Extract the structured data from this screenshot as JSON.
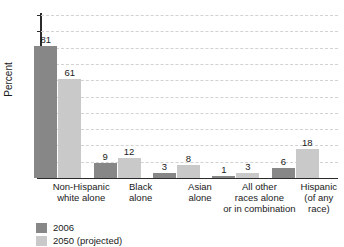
{
  "chart_data": {
    "type": "bar",
    "title": "",
    "xlabel": "",
    "ylabel": "Percent",
    "ylim": [
      0,
      100
    ],
    "ytick_step": 10,
    "yticks": [
      100,
      90,
      80,
      70,
      60,
      50,
      40,
      30,
      20,
      10,
      0
    ],
    "grid": true,
    "grid_style": "dashed-horizontal",
    "legend_position": "bottom-left",
    "categories": [
      "Non-Hispanic\nwhite alone",
      "Black\nalone",
      "Asian\nalone",
      "All other\nraces alone\nor in combination",
      "Hispanic\n(of any\nrace)"
    ],
    "category_lines": [
      [
        "Non-Hispanic",
        "white alone"
      ],
      [
        "Black",
        "alone"
      ],
      [
        "Asian",
        "alone"
      ],
      [
        "All other",
        "races alone",
        "or in combination"
      ],
      [
        "Hispanic",
        "(of any",
        "race)"
      ]
    ],
    "series": [
      {
        "name": "2006",
        "color": "#878787",
        "values": [
          81,
          9,
          3,
          1,
          6
        ]
      },
      {
        "name": "2050 (projected)",
        "color": "#c9c9c9",
        "values": [
          61,
          12,
          8,
          3,
          18
        ]
      }
    ]
  },
  "legend": {
    "entries": [
      {
        "label": "2006",
        "color": "#878787"
      },
      {
        "label": "2050 (projected)",
        "color": "#c9c9c9"
      }
    ]
  },
  "axis": {
    "y_label": "Percent"
  }
}
